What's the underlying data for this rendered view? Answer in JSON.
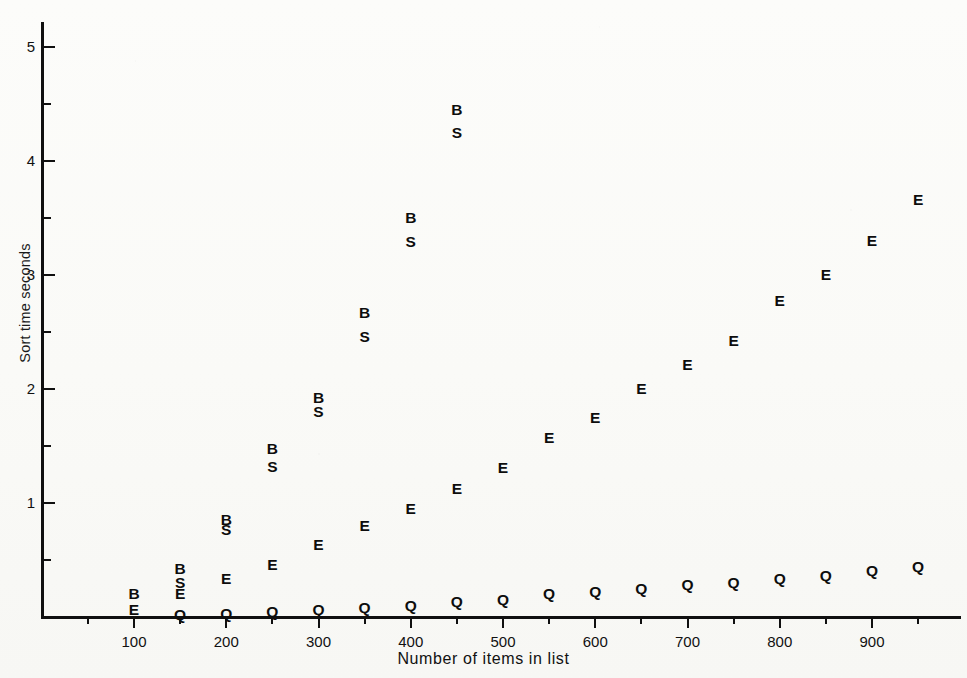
{
  "chart_data": {
    "type": "scatter",
    "title": "",
    "xlabel": "Number of items in list",
    "ylabel": "Sort time seconds",
    "xlim": [
      45,
      975
    ],
    "ylim": [
      0,
      5.25
    ],
    "grid": false,
    "legend": "none",
    "marker_style": "letter-glyph",
    "x_ticks_major": [
      100,
      200,
      300,
      400,
      500,
      600,
      700,
      800,
      900
    ],
    "x_ticks_minor": [
      50,
      150,
      250,
      350,
      450,
      550,
      650,
      750,
      850,
      950
    ],
    "y_ticks_major": [
      1,
      2,
      3,
      4,
      5
    ],
    "y_ticks_minor": [
      0.5,
      1.5,
      2.5,
      3.5,
      4.5
    ],
    "series": [
      {
        "name": "B",
        "marker": "B",
        "x": [
          100,
          150,
          200,
          250,
          300,
          350,
          400,
          450
        ],
        "values": [
          0.2,
          0.42,
          0.85,
          1.47,
          1.92,
          2.67,
          3.5,
          4.45
        ]
      },
      {
        "name": "S",
        "marker": "S",
        "x": [
          150,
          200,
          250,
          300,
          350,
          400,
          450
        ],
        "values": [
          0.3,
          0.76,
          1.32,
          1.8,
          2.46,
          3.29,
          4.25
        ]
      },
      {
        "name": "E",
        "marker": "E",
        "x": [
          100,
          150,
          200,
          250,
          300,
          350,
          400,
          450,
          500,
          550,
          600,
          650,
          700,
          750,
          800,
          850,
          900,
          950
        ],
        "values": [
          0.06,
          0.2,
          0.33,
          0.46,
          0.63,
          0.8,
          0.95,
          1.12,
          1.31,
          1.57,
          1.75,
          2.0,
          2.21,
          2.42,
          2.77,
          3.0,
          3.3,
          3.66
        ]
      },
      {
        "name": "Q",
        "marker": "Q",
        "x": [
          150,
          200,
          250,
          300,
          350,
          400,
          450,
          500,
          550,
          600,
          650,
          700,
          750,
          800,
          850,
          900,
          950
        ],
        "values": [
          0.02,
          0.03,
          0.04,
          0.06,
          0.08,
          0.1,
          0.13,
          0.15,
          0.2,
          0.22,
          0.25,
          0.28,
          0.3,
          0.33,
          0.36,
          0.4,
          0.44
        ]
      }
    ]
  },
  "axis": {
    "y_title": "Sort time seconds",
    "x_title": "Number of items in list"
  },
  "colors": {
    "ink": "#0d0d0d",
    "paper": "#fbfbf9"
  }
}
